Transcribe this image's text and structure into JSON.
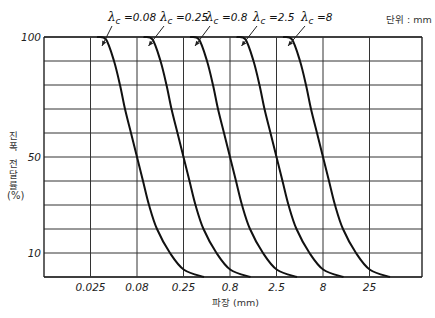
{
  "unit_note": "단위 : mm",
  "y_axis": {
    "label_line1": "진폭",
    "label_line2": "전달률",
    "unit": "(%)",
    "ticks": [
      {
        "label": "100",
        "value": 100
      },
      {
        "label": "50",
        "value": 50
      },
      {
        "label": "10",
        "value": 10
      }
    ]
  },
  "x_axis": {
    "label": "파장 (mm)",
    "ticks": [
      "0.025",
      "0.08",
      "0.25",
      "0.8",
      "2.5",
      "8",
      "25"
    ]
  },
  "curve_labels": [
    "λc = 0.08",
    "λc = 0.25",
    "λc = 0.8",
    "λc = 2.5",
    "λc = 8"
  ],
  "chart_data": {
    "type": "line",
    "title": "",
    "xlabel": "파장 (mm)",
    "ylabel": "진폭 전달률 (%)",
    "x_scale": "log",
    "x_ticks": [
      0.025,
      0.08,
      0.25,
      0.8,
      2.5,
      8,
      25
    ],
    "ylim": [
      0,
      100
    ],
    "grid": true,
    "annotation": "단위 : mm",
    "series": [
      {
        "name": "λc = 0.08",
        "cutoff": 0.08,
        "x": [
          0.045,
          0.08,
          0.14
        ],
        "y": [
          100,
          50,
          0
        ]
      },
      {
        "name": "λc = 0.25",
        "cutoff": 0.25,
        "x": [
          0.14,
          0.25,
          0.45
        ],
        "y": [
          100,
          50,
          0
        ]
      },
      {
        "name": "λc = 0.8",
        "cutoff": 0.8,
        "x": [
          0.45,
          0.8,
          1.4
        ],
        "y": [
          100,
          50,
          0
        ]
      },
      {
        "name": "λc = 2.5",
        "cutoff": 2.5,
        "x": [
          1.4,
          2.5,
          4.5
        ],
        "y": [
          100,
          50,
          0
        ]
      },
      {
        "name": "λc = 8",
        "cutoff": 8,
        "x": [
          4.5,
          8,
          14
        ],
        "y": [
          100,
          50,
          0
        ]
      }
    ],
    "curve_shape_offsets_px": {
      "description": "shape of each curve relative to its 50% crossing; column width = 46.5px per half-decade",
      "dx": [
        -40,
        -31,
        -23,
        -17,
        -12,
        -6,
        0,
        6,
        12,
        20,
        33,
        47,
        67
      ],
      "y": [
        100,
        99,
        90,
        80,
        70,
        60,
        50,
        40,
        30,
        20,
        10,
        3,
        0
      ]
    }
  }
}
